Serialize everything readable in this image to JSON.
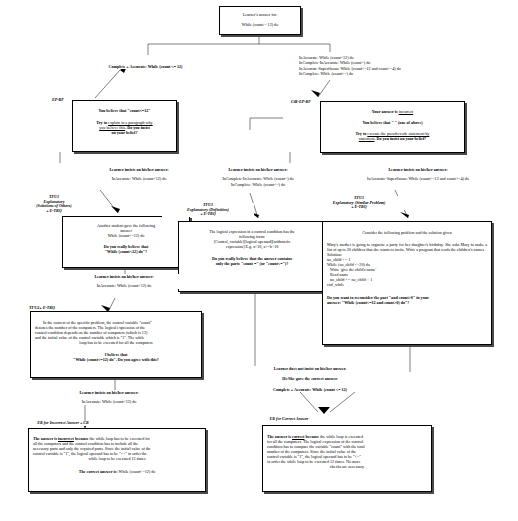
{
  "diagram": {
    "type": "flowchart"
  },
  "nodes": {
    "root": {
      "line1": "Learner's answer for:",
      "line2": "While (count = 12) do"
    },
    "ep_rf": {
      "label": "EP-RF",
      "line1": "You believe that \"count<=12\"",
      "line2_pre": "Try to ",
      "line2_link": "explain in a paragraph why",
      "line3_link": "you believe this",
      "line3_post": ". Do you insist",
      "line4": "on your belief?"
    },
    "cir_ep_rf": {
      "label": "CiR-EP-RF",
      "line1_pre": "Your answer is ",
      "line1_link": "incorrect",
      "line2": "You believe that \"    \" (one of above)",
      "line3_pre": "Try to ",
      "line3_link": "execute the pseudo-code statement by",
      "line4_link": "statement",
      "line4_post": ". Do you insist on your belief?"
    },
    "tfu1_solutions": {
      "label_l1": "TFU1",
      "label_l2": "Explanatory",
      "label_l3": "(Solutions of Others)",
      "label_l4": "+ E-TRQ",
      "line1": "Another student gave the following",
      "line2": "answer",
      "line3": "While (count<=12) do",
      "line4": "Do you really believe that",
      "line5": "\"While (count<12) do\"?"
    },
    "tfu1_definition": {
      "label_l1": "TFU1",
      "label_l2": "Explanatory (Definition)",
      "label_l3": "+ E-TRQ",
      "line1": "The logical expression in a control condition has the",
      "line2": "following form:",
      "line3": "[Control_variable][logical operand][arithmetic",
      "line4": "expression]  E.g. a<10, a>=b+10",
      "line5": "Do you really believe that the answer contains",
      "line6": "only the parts \"count =\" (or \"count<=\")?"
    },
    "tfu1_similar": {
      "label_l1": "TFU1",
      "label_l2": "Explanatory (Similar Problem)",
      "label_l3": "+ E-TRQ",
      "line1": "Consider the following problem and the solution given",
      "para": "Mary's mother is going to organize a party for her daughter's birthday. She asks Mary to make a list of up to 20 children that she wants to invite. Write a program that reads the children's names",
      "solution_label": "Solution:",
      "code": [
        "no_child <-- 1",
        "While (no_child <=20) do",
        "   Write 'give the child's name'",
        "   Read name",
        "   no_child <-- no_child + 1",
        "end_while"
      ],
      "q1": "Do you want to reconsider the part \"and count>0\" in your",
      "q2": "answer: \"While (count<=12 and count>0) do\"?"
    },
    "tfu2": {
      "label": "TFU2+ E-TRQ",
      "line1": "In the context of the specific problem, the control variable \"count\"",
      "line2": "denotes the number of the computers. The logical expression of the",
      "line3": "control condition depends on the number of computers (which is 12)",
      "line4": "and the initial value of the control variable which is \"1\". The while",
      "line5": "loop has to be executed for all the computers",
      "line6": "I believe that",
      "line7": "\"While (count<=12) do\". Do you agree with this?"
    },
    "er_incorrect": {
      "label": "ER for Incorrect Answer + CR",
      "p1_a": "The answer is ",
      "p1_link": "incorrect",
      "p1_b": " because ",
      "p1_c": "the while loop has to be executed for",
      "l2": "all the computers and the control condition has to include all the",
      "l3": "necessary parts and only the required parts. Since the initial value of the",
      "l4": "control variable is \"1\", the logical operand has to be \"<=\" in order the",
      "l5": "while loop to be executed 12 times",
      "final_a": "The correct answer is: ",
      "final_b": "While (count<=12) do"
    },
    "er_correct": {
      "label": "ER for Correct Answer",
      "p1_a": "The answer is ",
      "p1_link": "correct",
      "p1_b": " because ",
      "p1_c": "the while loop is executed",
      "l2": "for all the computers. The logical expression of the control",
      "l3": "condition has to compare the variable \"count\" with the total",
      "l4": "number of the computers. Since the initial value of the",
      "l5": "control variable is \"1\", the logical operand has to be \"<=\"",
      "l6": "in order the while loop to be executed 12 times. No more",
      "l7": "checks are necessary"
    }
  },
  "edges": {
    "complete_accurate_top": "Complete + Accurate: While (count <= 12)",
    "wrong_branch": [
      "InAccurate: While (count<12) do",
      "InComplete-InAccurate: While (count=) do",
      "InAccurate-Superfluous: While (count<=12 and count>=4) do",
      "InComplete: While (count<=) do"
    ],
    "insists_left": {
      "head": "Learner insists on his/her answer:",
      "body": "InAccurate: While (count<12) do"
    },
    "insists_mid": {
      "head": "Learner insists on his/her answer:",
      "body1": "InComplete-InAccurate: While (count=) do",
      "body2": "InComplete: While (count<=) do"
    },
    "insists_right": {
      "head": "Learner insists on his/her answer:",
      "body": "InAccurate-Superfluous: While (count<=12 and count>=4) do"
    },
    "insists_left2": {
      "head": "Learner insists on his/her answer:",
      "body": "InAccurate: While (count<12) do"
    },
    "not_insist": {
      "l1": "Learner does not insist on his/her answer.",
      "l2": "He/She gave the correct answer.",
      "l3": "Complete + Accurate: While (count <= 12)"
    },
    "insists_bottom": {
      "head": "Learner insists on his/her answer:",
      "body": "InAccurate: While (count<12) do"
    }
  },
  "colors": {
    "ink": "#000000",
    "paper": "#ffffff",
    "shadow": "#4a4a4a"
  }
}
